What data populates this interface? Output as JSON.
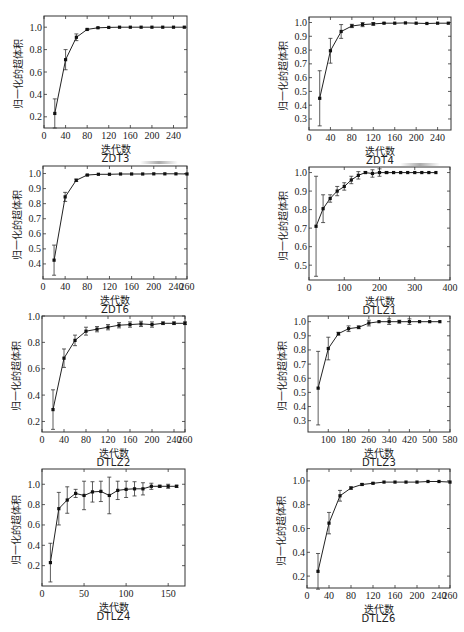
{
  "figure": {
    "ylabel": "归一化的超体积",
    "xlabel": "迭代数"
  },
  "chart_data": [
    {
      "id": "zdt3",
      "type": "line",
      "title": "ZDT3",
      "xlabel": "迭代数",
      "ylabel": "归一化的超体积",
      "frame": {
        "left": 44,
        "top": 16,
        "right": 187,
        "bottom": 128
      },
      "xlim": [
        0,
        265
      ],
      "ylim": [
        0.1,
        1.1
      ],
      "xticks": [
        0,
        40,
        80,
        120,
        160,
        200,
        240
      ],
      "yticks": [
        0.2,
        0.4,
        0.6,
        0.8,
        1.0
      ],
      "ytick_labels": [
        "0.2",
        "0.4",
        "0.6",
        "0.8",
        "1.0"
      ],
      "grid": false,
      "x": [
        20,
        40,
        60,
        80,
        100,
        120,
        140,
        160,
        180,
        200,
        220,
        240,
        260
      ],
      "y": [
        0.23,
        0.71,
        0.91,
        0.98,
        0.995,
        0.998,
        1.0,
        1.0,
        1.0,
        1.0,
        1.0,
        1.0,
        1.0
      ],
      "err": [
        0.13,
        0.09,
        0.03,
        0.005,
        0.003,
        0,
        0,
        0,
        0,
        0,
        0,
        0,
        0
      ]
    },
    {
      "id": "zdt4",
      "type": "line",
      "title": "ZDT4",
      "xlabel": "迭代数",
      "ylabel": "归一化的超体积",
      "frame": {
        "left": 309,
        "top": 17,
        "right": 451,
        "bottom": 130
      },
      "xlim": [
        0,
        265
      ],
      "ylim": [
        0.22,
        1.04
      ],
      "xticks": [
        0,
        40,
        80,
        120,
        160,
        200,
        240
      ],
      "yticks": [
        0.3,
        0.4,
        0.5,
        0.6,
        0.7,
        0.8,
        0.9,
        1.0
      ],
      "ytick_labels": [
        "0.3",
        "0.4",
        "0.5",
        "0.6",
        "0.7",
        "0.8",
        "0.9",
        "1.0"
      ],
      "grid": false,
      "x": [
        20,
        40,
        60,
        80,
        100,
        120,
        140,
        160,
        180,
        200,
        220,
        240,
        260
      ],
      "y": [
        0.45,
        0.795,
        0.935,
        0.975,
        0.985,
        0.99,
        0.995,
        0.995,
        0.997,
        0.995,
        0.993,
        0.995,
        0.995
      ],
      "err": [
        0.2,
        0.09,
        0.05,
        0.012,
        0.015,
        0.01,
        0.003,
        0,
        0,
        0,
        0,
        0,
        0
      ]
    },
    {
      "id": "zdt6",
      "type": "line",
      "title": "ZDT6",
      "xlabel": "迭代数",
      "ylabel": "归一化的超体积",
      "frame": {
        "left": 43,
        "top": 166,
        "right": 187,
        "bottom": 279
      },
      "xlim": [
        0,
        260
      ],
      "ylim": [
        0.3,
        1.05
      ],
      "xticks": [
        0,
        40,
        80,
        120,
        160,
        200,
        240,
        260
      ],
      "yticks": [
        0.4,
        0.5,
        0.6,
        0.7,
        0.8,
        0.9,
        1.0
      ],
      "ytick_labels": [
        "0.4",
        "0.5",
        "0.6",
        "0.7",
        "0.8",
        "0.9",
        "1.0"
      ],
      "grid": false,
      "x": [
        20,
        40,
        60,
        80,
        100,
        120,
        140,
        160,
        180,
        200,
        220,
        240,
        260
      ],
      "y": [
        0.425,
        0.845,
        0.955,
        0.99,
        0.995,
        0.995,
        0.997,
        0.997,
        0.997,
        0.998,
        0.998,
        0.998,
        0.997
      ],
      "err": [
        0.1,
        0.03,
        0.008,
        0.004,
        0,
        0,
        0,
        0,
        0,
        0,
        0,
        0,
        0
      ]
    },
    {
      "id": "dtlz1",
      "type": "line",
      "title": "DTLZ1",
      "xlabel": "迭代数",
      "ylabel": "归一化的超体积",
      "frame": {
        "left": 309,
        "top": 167,
        "right": 450,
        "bottom": 280
      },
      "xlim": [
        0,
        400
      ],
      "ylim": [
        0.42,
        1.03
      ],
      "xticks": [
        0,
        100,
        200,
        300,
        400
      ],
      "yticks": [
        0.5,
        0.6,
        0.7,
        0.8,
        0.9,
        1.0
      ],
      "ytick_labels": [
        "0.5",
        "0.6",
        "0.7",
        "0.8",
        "0.9",
        "1.0"
      ],
      "grid": false,
      "x": [
        20,
        40,
        60,
        80,
        100,
        120,
        140,
        160,
        180,
        200,
        220,
        240,
        260,
        280,
        300,
        320,
        340,
        360
      ],
      "y": [
        0.71,
        0.805,
        0.86,
        0.9,
        0.925,
        0.96,
        0.985,
        1.0,
        0.995,
        1.0,
        1.0,
        1.0,
        1.0,
        1.0,
        1.0,
        1.0,
        1.0,
        1.0
      ],
      "err": [
        0.27,
        0.075,
        0.02,
        0.025,
        0.02,
        0.02,
        0.02,
        0.005,
        0.02,
        0.02,
        0.005,
        0,
        0,
        0,
        0,
        0,
        0,
        0
      ]
    },
    {
      "id": "dtlz2",
      "type": "line",
      "title": "DTLZ2",
      "xlabel": "迭代数",
      "ylabel": "归一化的超体积",
      "frame": {
        "left": 42,
        "top": 316,
        "right": 185,
        "bottom": 432
      },
      "xlim": [
        0,
        260
      ],
      "ylim": [
        0.12,
        1.0
      ],
      "xticks": [
        0,
        40,
        80,
        120,
        160,
        200,
        240,
        260
      ],
      "yticks": [
        0.2,
        0.4,
        0.6,
        0.8,
        1.0
      ],
      "ytick_labels": [
        "0.2",
        "0.4",
        "0.6",
        "0.8",
        "1.0"
      ],
      "grid": false,
      "x": [
        20,
        40,
        60,
        80,
        100,
        120,
        140,
        160,
        180,
        200,
        220,
        240,
        260
      ],
      "y": [
        0.29,
        0.68,
        0.815,
        0.885,
        0.9,
        0.915,
        0.93,
        0.935,
        0.94,
        0.935,
        0.945,
        0.945,
        0.945
      ],
      "err": [
        0.15,
        0.07,
        0.04,
        0.03,
        0.02,
        0.02,
        0.02,
        0.02,
        0.02,
        0.02,
        0.01,
        0.01,
        0.01
      ]
    },
    {
      "id": "dtlz3",
      "type": "line",
      "title": "DTLZ3",
      "xlabel": "迭代数",
      "ylabel": "归一化的超体积",
      "frame": {
        "left": 308,
        "top": 316,
        "right": 450,
        "bottom": 432
      },
      "xlim": [
        20,
        580
      ],
      "ylim": [
        0.22,
        1.04
      ],
      "xticks": [
        100,
        180,
        260,
        340,
        420,
        500,
        580
      ],
      "yticks": [
        0.3,
        0.4,
        0.5,
        0.6,
        0.7,
        0.8,
        0.9,
        1.0
      ],
      "ytick_labels": [
        "0.3",
        "0.4",
        "0.5",
        "0.6",
        "0.7",
        "0.8",
        "0.9",
        "1.0"
      ],
      "grid": false,
      "x": [
        60,
        100,
        140,
        180,
        220,
        260,
        300,
        340,
        380,
        420,
        460,
        500,
        540
      ],
      "y": [
        0.53,
        0.81,
        0.915,
        0.95,
        0.96,
        0.99,
        1.0,
        1.0,
        1.0,
        1.0,
        1.0,
        1.0,
        1.0
      ],
      "err": [
        0.26,
        0.08,
        0.01,
        0.02,
        0.01,
        0.02,
        0,
        0.02,
        0.01,
        0.02,
        0,
        0,
        0
      ]
    },
    {
      "id": "dtlz4",
      "type": "line",
      "title": "DTLZ4",
      "xlabel": "迭代数",
      "ylabel": "归一化的超体积",
      "frame": {
        "left": 42,
        "top": 469,
        "right": 185,
        "bottom": 586
      },
      "xlim": [
        0,
        170
      ],
      "ylim": [
        0.0,
        1.15
      ],
      "xticks": [
        0,
        50,
        100,
        150
      ],
      "yticks": [
        0.2,
        0.4,
        0.6,
        0.8,
        1.0
      ],
      "ytick_labels": [
        "0.2",
        "0.4",
        "0.6",
        "0.8",
        "1.0"
      ],
      "grid": false,
      "x": [
        10,
        20,
        30,
        40,
        50,
        60,
        70,
        80,
        90,
        100,
        110,
        120,
        130,
        140,
        150,
        160
      ],
      "y": [
        0.23,
        0.76,
        0.845,
        0.91,
        0.89,
        0.925,
        0.93,
        0.89,
        0.94,
        0.95,
        0.955,
        0.955,
        0.98,
        0.98,
        0.98,
        0.98
      ],
      "err": [
        0.19,
        0.16,
        0.13,
        0.04,
        0.14,
        0.1,
        0.1,
        0.18,
        0.09,
        0.08,
        0.07,
        0.06,
        0.03,
        0.01,
        0.02,
        0.01
      ]
    },
    {
      "id": "dtlz6",
      "type": "line",
      "title": "DTLZ6",
      "xlabel": "迭代数",
      "ylabel": "归一化的超体积",
      "frame": {
        "left": 307,
        "top": 469,
        "right": 450,
        "bottom": 588
      },
      "xlim": [
        0,
        260
      ],
      "ylim": [
        0.1,
        1.1
      ],
      "xticks": [
        0,
        40,
        80,
        120,
        160,
        200,
        240,
        260
      ],
      "yticks": [
        0.2,
        0.4,
        0.6,
        0.8,
        1.0
      ],
      "ytick_labels": [
        "0.2",
        "0.4",
        "0.6",
        "0.8",
        "1.0"
      ],
      "grid": false,
      "x": [
        20,
        40,
        60,
        80,
        100,
        120,
        140,
        160,
        180,
        200,
        220,
        240,
        260
      ],
      "y": [
        0.24,
        0.645,
        0.875,
        0.94,
        0.97,
        0.98,
        0.99,
        0.99,
        0.99,
        0.99,
        0.995,
        0.995,
        0.99
      ],
      "err": [
        0.15,
        0.09,
        0.045,
        0.01,
        0.008,
        0.005,
        0,
        0,
        0,
        0,
        0,
        0,
        0
      ]
    }
  ]
}
